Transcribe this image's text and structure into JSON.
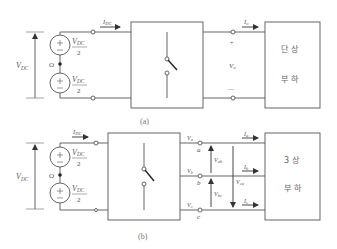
{
  "figure": {
    "panel_a": {
      "caption": "(a)",
      "source_total_label": "V",
      "source_total_sub": "DC",
      "source_top": {
        "num": "V",
        "num_sub": "DC",
        "den": "2",
        "polarity": "+"
      },
      "source_bottom": {
        "num": "V",
        "num_sub": "DC",
        "den": "2",
        "polarity": "+"
      },
      "midpoint_label": "O",
      "input_current": "I",
      "input_current_sub": "DC",
      "output_current": "I",
      "output_current_sub": "o",
      "output_voltage": "V",
      "output_voltage_sub": "o",
      "output_plus": "+",
      "output_minus": "—",
      "load_line1": "단 상",
      "load_line2": "부 하"
    },
    "panel_b": {
      "caption": "(b)",
      "source_total_label": "V",
      "source_total_sub": "DC",
      "source_top": {
        "num": "V",
        "num_sub": "DC",
        "den": "2",
        "polarity": "+"
      },
      "source_bottom": {
        "num": "V",
        "num_sub": "DC",
        "den": "2",
        "polarity": "+"
      },
      "midpoint_label": "O",
      "input_current": "I",
      "input_current_sub": "DC",
      "phases": [
        {
          "node": "a",
          "voltage": "V",
          "voltage_sub": "a",
          "current": "I",
          "current_sub": "a"
        },
        {
          "node": "b",
          "voltage": "V",
          "voltage_sub": "b",
          "current": "I",
          "current_sub": "b"
        },
        {
          "node": "c",
          "voltage": "V",
          "voltage_sub": "c",
          "current": "I",
          "current_sub": "c"
        }
      ],
      "line_voltages": [
        {
          "label": "V",
          "sub": "ab"
        },
        {
          "label": "V",
          "sub": "bc"
        },
        {
          "label": "V",
          "sub": "ca"
        }
      ],
      "load_line1": "3 상",
      "load_line2": "부 하"
    }
  }
}
